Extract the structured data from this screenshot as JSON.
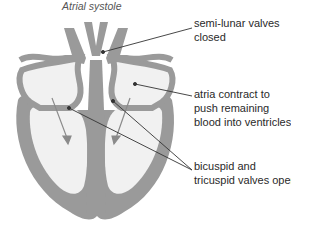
{
  "title": "Atrial systole",
  "labels": {
    "semilunar": {
      "line1": "semi-lunar valves",
      "line2": "closed"
    },
    "atria": {
      "line1": "atria contract to",
      "line2": "push remaining",
      "line3": "blood into ventricles"
    },
    "valves": {
      "line1": "bicuspid and",
      "line2": "tricuspid valves open"
    }
  },
  "colors": {
    "muscle": "#9a9a9a",
    "chamber": "#f1f1f1",
    "leader": "#333333",
    "text": "#2a2a2a"
  }
}
